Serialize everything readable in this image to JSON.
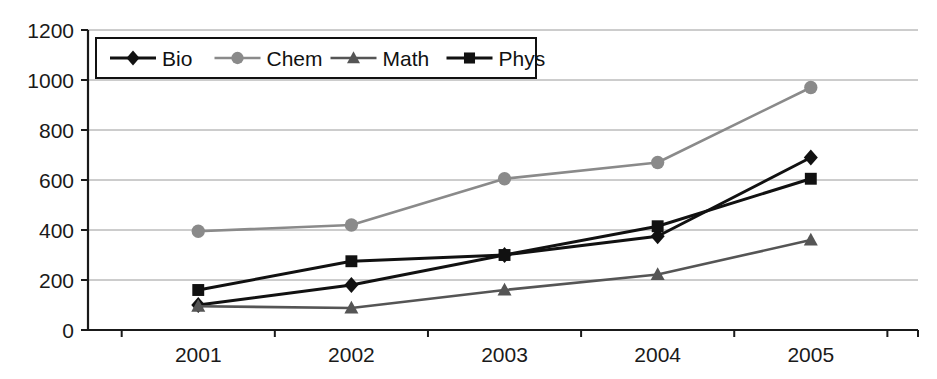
{
  "chart_data": {
    "type": "line",
    "title": "",
    "xlabel": "",
    "ylabel": "",
    "x": [
      "2001",
      "2002",
      "2003",
      "2004",
      "2005"
    ],
    "categories": [
      "2001",
      "2002",
      "2003",
      "2004",
      "2005"
    ],
    "ylim": [
      0,
      1200
    ],
    "yticks": [
      0,
      200,
      400,
      600,
      800,
      1000,
      1200
    ],
    "ytick_labels": [
      "0",
      "200",
      "400",
      "600",
      "800",
      "1000",
      "1200"
    ],
    "xtick_labels": [
      "2001",
      "2002",
      "2003",
      "2004",
      "2005"
    ],
    "grid": true,
    "grid_axis": "y",
    "legend_position": "top-left-inside",
    "series": [
      {
        "name": "Bio",
        "marker": "diamond",
        "color": "#111111",
        "values": [
          100,
          180,
          300,
          375,
          690
        ]
      },
      {
        "name": "Chem",
        "marker": "circle",
        "color": "#8a8a8a",
        "values": [
          395,
          420,
          605,
          670,
          970
        ]
      },
      {
        "name": "Math",
        "marker": "triangle",
        "color": "#555555",
        "values": [
          95,
          88,
          160,
          222,
          360
        ]
      },
      {
        "name": "Phys",
        "marker": "square",
        "color": "#111111",
        "values": [
          160,
          275,
          300,
          415,
          605
        ]
      }
    ]
  },
  "legend": {
    "items": [
      {
        "label": "Bio"
      },
      {
        "label": "Chem"
      },
      {
        "label": "Math"
      },
      {
        "label": "Phys"
      }
    ]
  },
  "axes": {
    "y_labels": [
      "1200",
      "1000",
      "800",
      "600",
      "400",
      "200",
      "0"
    ],
    "x_labels": [
      "2001",
      "2002",
      "2003",
      "2004",
      "2005"
    ]
  },
  "colors": {
    "bio": "#111111",
    "chem": "#8a8a8a",
    "math": "#555555",
    "phys": "#111111",
    "grid": "#9a9a9a",
    "axis": "#1a1a1a",
    "background": "#ffffff"
  }
}
